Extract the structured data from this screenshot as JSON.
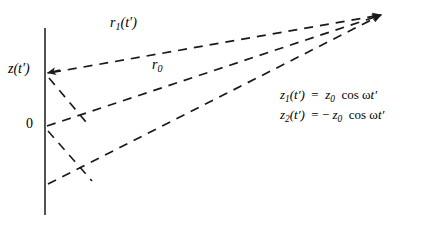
{
  "figure": {
    "background_color": "#ffffff",
    "line_color": "#1a1a1a",
    "width": 433,
    "height": 225
  },
  "axis": {
    "name": "z-axis",
    "orientation": "vertical",
    "x": 45,
    "y_top": 28,
    "y_bottom": 215,
    "origin_label": "0",
    "origin_y": 126
  },
  "labels": {
    "r1": "r₁(t′)",
    "r0": "r₀",
    "z_of_t": "z(t′)",
    "origin": "0"
  },
  "equations": {
    "eq1": "z₁(t′) = z₀ cos ωt′",
    "eq2": "z₂(t′) = −z₀ cos ωt′"
  },
  "rays": [
    {
      "name": "ray-r1",
      "label": "r₁(t′)",
      "from": [
        47,
        73
      ],
      "to": [
        383,
        14
      ],
      "style": "dashed",
      "has_arrowhead": true
    },
    {
      "name": "ray-r0",
      "label": "r₀",
      "from": [
        46,
        126
      ],
      "to": [
        383,
        14
      ],
      "style": "dashed",
      "has_arrowhead": true
    },
    {
      "name": "ray-r2",
      "label": "",
      "from": [
        48,
        183
      ],
      "to": [
        383,
        14
      ],
      "style": "dashed",
      "has_arrowhead": true
    }
  ],
  "connectors": [
    {
      "name": "connector-upper",
      "from": [
        49,
        76
      ],
      "to": [
        84,
        122
      ],
      "style": "dashed"
    },
    {
      "name": "connector-lower",
      "from": [
        48,
        130
      ],
      "to": [
        90,
        180
      ],
      "style": "dashed"
    }
  ],
  "markers": {
    "z_arrowhead": {
      "name": "z-position-arrowhead",
      "x": 47,
      "y": 73,
      "direction": "left"
    },
    "convergence_arrowhead": {
      "name": "observation-point-arrowhead",
      "x": 385,
      "y": 13,
      "direction": "upper-right"
    }
  }
}
